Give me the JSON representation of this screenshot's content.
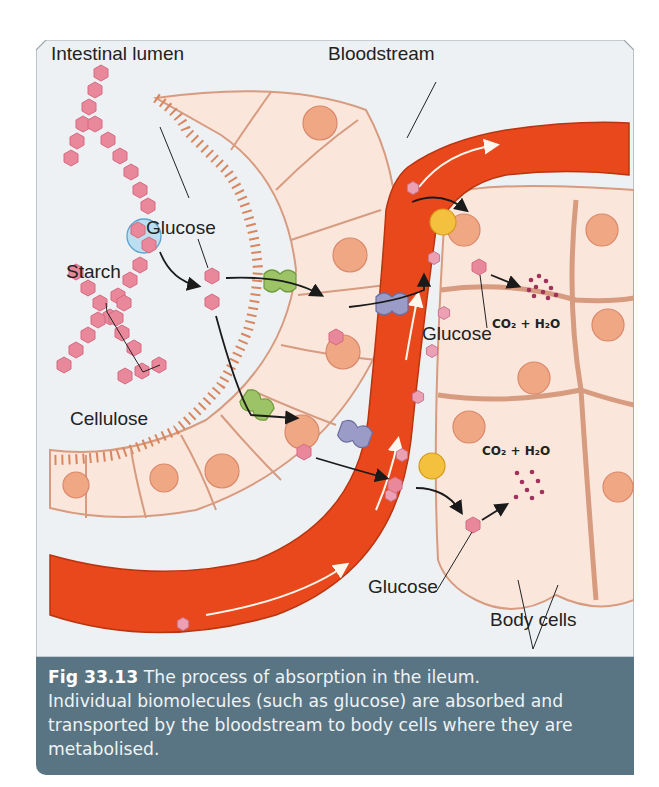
{
  "figure": {
    "number": "Fig 33.13",
    "caption_lead": " The process of absorption in the ileum.",
    "caption_body": "Individual biomolecules (such as glucose) are absorbed and transported by the bloodstream to body cells where they are metabolised."
  },
  "labels": {
    "intestinal_lumen": "Intestinal lumen",
    "bloodstream": "Bloodstream",
    "glucose_lumen": "Glucose",
    "starch": "Starch",
    "cellulose": "Cellulose",
    "glucose_cell_upper": "Glucose",
    "glucose_cell_lower": "Glucose",
    "body_cells": "Body cells",
    "co2_h2o_upper": "CO₂ + H₂O",
    "co2_h2o_lower": "CO₂ + H₂O"
  },
  "colors": {
    "background_panel": "#eef1f4",
    "blood_vessel": "#e8481c",
    "cell_fill": "#fbe6db",
    "nucleus": "#f0a884",
    "glucose_molecule": "#e9879b",
    "carrier_green": "#9cc466",
    "carrier_purple": "#8f8fbd",
    "carrier_yellow": "#f4c13f",
    "caption_band": "#597583"
  }
}
